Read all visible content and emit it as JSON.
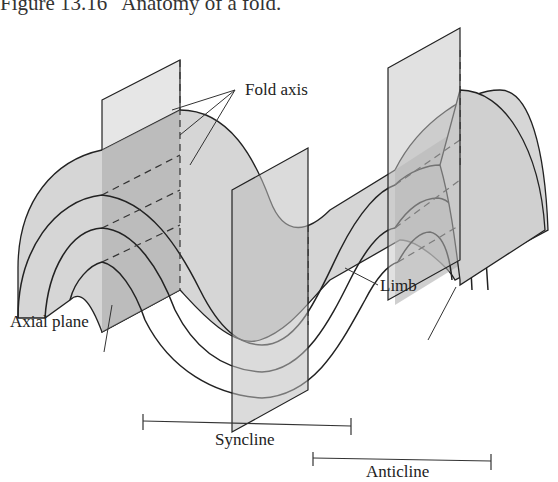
{
  "figure": {
    "number": "Figure 13.16",
    "caption": "Anatomy of a fold."
  },
  "labels": {
    "fold_axis": "Fold axis",
    "axial_plane": "Axial plane",
    "limb": "Limb",
    "syncline": "Syncline",
    "anticline": "Anticline"
  },
  "colors": {
    "fold_surface": "#d4d4d4",
    "fold_front": "#cbcbcb",
    "plane": "#e3e3e3",
    "plane_shadow": "#9e9e9e",
    "line": "#222222"
  }
}
